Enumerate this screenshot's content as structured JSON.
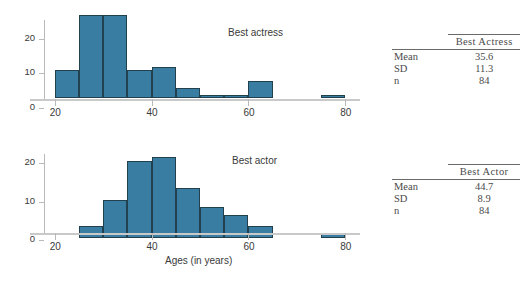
{
  "chart_data": [
    {
      "type": "bar",
      "title": "Best actress",
      "xlabel": "Ages (in years)",
      "ylabel": "",
      "bin_width": 5,
      "xlim": [
        18,
        82
      ],
      "ylim": [
        0,
        25
      ],
      "xticks": [
        20,
        40,
        60,
        80
      ],
      "yticks": [
        0,
        10,
        20
      ],
      "grid": false,
      "bin_starts": [
        20,
        25,
        30,
        35,
        40,
        45,
        50,
        55,
        60,
        65,
        70,
        75
      ],
      "categories": [
        "20-25",
        "25-30",
        "30-35",
        "35-40",
        "40-45",
        "45-50",
        "50-55",
        "55-60",
        "60-65",
        "65-70",
        "70-75",
        "75-80"
      ],
      "values": [
        8,
        24,
        24,
        8,
        9,
        3,
        1,
        1,
        5,
        0,
        0,
        1
      ]
    },
    {
      "type": "bar",
      "title": "Best actor",
      "xlabel": "Ages (in years)",
      "ylabel": "",
      "bin_width": 5,
      "xlim": [
        18,
        82
      ],
      "ylim": [
        0,
        22
      ],
      "xticks": [
        20,
        40,
        60,
        80
      ],
      "yticks": [
        0,
        10,
        20
      ],
      "grid": false,
      "bin_starts": [
        20,
        25,
        30,
        35,
        40,
        45,
        50,
        55,
        60,
        65,
        70,
        75
      ],
      "categories": [
        "20-25",
        "25-30",
        "30-35",
        "35-40",
        "40-45",
        "45-50",
        "50-55",
        "55-60",
        "60-65",
        "65-70",
        "70-75",
        "75-80"
      ],
      "values": [
        0,
        3,
        10,
        20,
        21,
        13,
        8,
        6,
        3,
        0,
        0,
        1
      ]
    }
  ],
  "figures": {
    "actress": {
      "label": "Best actress",
      "y_tick_labels": [
        "0",
        "10",
        "20"
      ],
      "x_tick_labels": [
        "20",
        "40",
        "60",
        "80"
      ]
    },
    "actor": {
      "label": "Best actor",
      "y_tick_labels": [
        "0",
        "10",
        "20"
      ],
      "x_tick_labels": [
        "20",
        "40",
        "60",
        "80"
      ]
    }
  },
  "axis_title": "Ages (in years)",
  "tables": [
    {
      "name": "best-actress-stats",
      "header": "Best Actress",
      "rows": [
        {
          "label": "Mean",
          "value": "35.6"
        },
        {
          "label": "SD",
          "value": "11.3"
        },
        {
          "label": "n",
          "value": "84"
        }
      ]
    },
    {
      "name": "best-actor-stats",
      "header": "Best Actor",
      "rows": [
        {
          "label": "Mean",
          "value": "44.7"
        },
        {
          "label": "SD",
          "value": "8.9"
        },
        {
          "label": "n",
          "value": "84"
        }
      ]
    }
  ],
  "colors": {
    "bar_fill": "#3a7da2",
    "bar_edge": "#21414f",
    "axis": "#c9c9c9",
    "text": "#3a3a3a"
  }
}
